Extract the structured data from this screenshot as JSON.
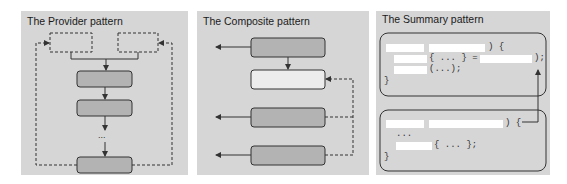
{
  "panels": [
    {
      "title": "The Provider pattern",
      "ellipsis": "...",
      "nodes": [
        {
          "id": "provider-source-left",
          "style": "dashed"
        },
        {
          "id": "provider-source-right",
          "style": "dashed"
        },
        {
          "id": "provider-step-1",
          "style": "solid-dark"
        },
        {
          "id": "provider-step-2",
          "style": "solid-dark"
        },
        {
          "id": "provider-step-n",
          "style": "solid-dark"
        }
      ]
    },
    {
      "title": "The Composite pattern",
      "nodes": [
        {
          "id": "composite-top",
          "style": "solid-dark"
        },
        {
          "id": "composite-root",
          "style": "solid-light"
        },
        {
          "id": "composite-child-1",
          "style": "solid-dark"
        },
        {
          "id": "composite-child-2",
          "style": "solid-dark"
        }
      ]
    },
    {
      "title": "The Summary pattern",
      "code_block_1": {
        "line1_suffix": ") {",
        "line2_mid": "{ ... } =",
        "line2_suffix": ");",
        "line3_suffix": "(...);",
        "closing": "}"
      },
      "code_block_2": {
        "line1_suffix": ") {",
        "line2": "...",
        "line3_suffix": "{ ... };",
        "closing": "}"
      }
    }
  ],
  "colors": {
    "panel_bg": "#d6d6d6",
    "box_dark": "#b3b3b3",
    "box_light": "#ececec",
    "stroke": "#333333",
    "blank": "#ffffff"
  }
}
